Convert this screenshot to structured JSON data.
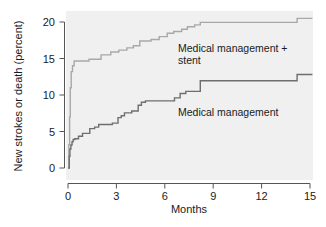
{
  "chart_data": {
    "type": "line",
    "subtype": "kaplan-meier-step",
    "title": "",
    "xlabel": "Months",
    "ylabel": "New strokes or death (percent)",
    "xlim": [
      -0.35,
      15.3
    ],
    "ylim": [
      -1.2,
      21.5
    ],
    "xticks": [
      0,
      3,
      6,
      9,
      12,
      15
    ],
    "xtick_labels": [
      "0",
      "3",
      "6",
      "9",
      "12",
      "15"
    ],
    "yticks": [
      0,
      5,
      10,
      15,
      20
    ],
    "ytick_labels": [
      "0",
      "5",
      "10",
      "15",
      "20"
    ],
    "grid": false,
    "legend_position": "inline-annotation",
    "panel_background": "#f0f0f0",
    "figure_background": "#ffffff",
    "series": [
      {
        "name": "Medical management + stent",
        "color": "#a8a8a8",
        "label_position": "inline-right-upper",
        "final_value": 20.5,
        "points": [
          [
            0.0,
            0.0
          ],
          [
            0.05,
            3.2
          ],
          [
            0.1,
            7.0
          ],
          [
            0.14,
            11.0
          ],
          [
            0.2,
            13.2
          ],
          [
            0.28,
            14.0
          ],
          [
            0.38,
            14.65
          ],
          [
            1.25,
            14.65
          ],
          [
            1.3,
            14.9
          ],
          [
            2.0,
            14.9
          ],
          [
            2.05,
            15.5
          ],
          [
            2.6,
            15.5
          ],
          [
            2.65,
            15.9
          ],
          [
            3.1,
            15.9
          ],
          [
            3.15,
            16.15
          ],
          [
            3.6,
            16.15
          ],
          [
            3.65,
            16.45
          ],
          [
            4.0,
            16.45
          ],
          [
            4.05,
            16.75
          ],
          [
            4.4,
            16.75
          ],
          [
            4.45,
            17.4
          ],
          [
            5.1,
            17.4
          ],
          [
            5.15,
            17.6
          ],
          [
            5.6,
            17.6
          ],
          [
            5.65,
            18.0
          ],
          [
            6.1,
            18.0
          ],
          [
            6.15,
            18.45
          ],
          [
            6.5,
            18.45
          ],
          [
            6.55,
            18.7
          ],
          [
            7.0,
            18.7
          ],
          [
            7.05,
            19.0
          ],
          [
            7.35,
            19.0
          ],
          [
            7.4,
            19.35
          ],
          [
            7.8,
            19.35
          ],
          [
            7.85,
            19.6
          ],
          [
            8.15,
            19.6
          ],
          [
            8.2,
            19.95
          ],
          [
            14.15,
            19.95
          ],
          [
            14.2,
            20.5
          ],
          [
            15.15,
            20.5
          ]
        ]
      },
      {
        "name": "Medical management",
        "color": "#6e6e6e",
        "label_position": "inline-right-lower",
        "final_value": 12.8,
        "points": [
          [
            0.0,
            0.0
          ],
          [
            0.08,
            1.6
          ],
          [
            0.12,
            2.6
          ],
          [
            0.18,
            3.15
          ],
          [
            0.25,
            3.6
          ],
          [
            0.32,
            3.9
          ],
          [
            0.42,
            4.0
          ],
          [
            0.6,
            4.0
          ],
          [
            0.65,
            4.35
          ],
          [
            0.85,
            4.35
          ],
          [
            0.9,
            4.75
          ],
          [
            1.3,
            4.75
          ],
          [
            1.35,
            5.4
          ],
          [
            1.6,
            5.4
          ],
          [
            1.65,
            5.6
          ],
          [
            1.85,
            5.6
          ],
          [
            1.9,
            5.95
          ],
          [
            2.7,
            5.95
          ],
          [
            2.75,
            6.15
          ],
          [
            3.05,
            6.15
          ],
          [
            3.1,
            6.9
          ],
          [
            3.25,
            6.9
          ],
          [
            3.3,
            7.15
          ],
          [
            3.45,
            7.15
          ],
          [
            3.5,
            7.55
          ],
          [
            3.9,
            7.55
          ],
          [
            3.95,
            7.8
          ],
          [
            4.3,
            7.8
          ],
          [
            4.35,
            8.6
          ],
          [
            4.5,
            8.6
          ],
          [
            4.55,
            9.0
          ],
          [
            4.75,
            9.0
          ],
          [
            4.8,
            9.2
          ],
          [
            6.55,
            9.2
          ],
          [
            6.6,
            9.6
          ],
          [
            6.9,
            9.6
          ],
          [
            6.95,
            10.2
          ],
          [
            7.25,
            10.2
          ],
          [
            7.3,
            10.5
          ],
          [
            8.15,
            10.5
          ],
          [
            8.2,
            11.95
          ],
          [
            14.15,
            11.95
          ],
          [
            14.2,
            12.8
          ],
          [
            15.15,
            12.8
          ]
        ]
      }
    ],
    "annotations": [
      {
        "text": "Medical management +",
        "line2": "stent",
        "x": 6.4,
        "y": 17.2
      },
      {
        "text": "Medical management",
        "x": 6.4,
        "y": 8.9
      }
    ]
  },
  "axes": {
    "ylabel": "New strokes or death (percent)",
    "xlabel": "Months",
    "ytick_labels": [
      "20",
      "15",
      "10",
      "5",
      "0"
    ],
    "xtick_labels": [
      "0",
      "3",
      "6",
      "9",
      "12",
      "15"
    ]
  },
  "labels": {
    "stent_line1": "Medical management +",
    "stent_line2": "stent",
    "medical": "Medical management"
  },
  "colors": {
    "stent_line": "#a8a8a8",
    "medical_line": "#6e6e6e",
    "axis": "#555555",
    "panel": "#f0f0f0",
    "text": "#1a1a1a"
  }
}
